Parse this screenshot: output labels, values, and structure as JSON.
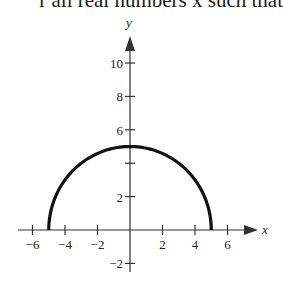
{
  "header_text": "r all real numbers x such that",
  "chart_data": {
    "type": "line",
    "title": "",
    "xlabel": "x",
    "ylabel": "y",
    "xlim": [
      -6.5,
      7.5
    ],
    "ylim": [
      -2.5,
      12
    ],
    "x_ticks": [
      -6,
      -4,
      -2,
      2,
      4,
      6
    ],
    "y_ticks": [
      -2,
      2,
      4,
      6,
      8,
      10
    ],
    "x_tick_labels": [
      "-6",
      "-4",
      "-2",
      "2",
      "4",
      "6"
    ],
    "y_tick_labels": [
      "-2",
      "2",
      "6",
      "8",
      "10"
    ],
    "grid": false,
    "legend": null,
    "series": [
      {
        "name": "semicircle",
        "x": [
          -5,
          -4,
          -3,
          -2,
          -1,
          0,
          1,
          2,
          3,
          4,
          5
        ],
        "y": [
          0,
          3,
          4,
          4.58,
          4.9,
          5,
          4.9,
          4.58,
          4,
          3,
          0
        ],
        "color": "#111111"
      }
    ]
  }
}
